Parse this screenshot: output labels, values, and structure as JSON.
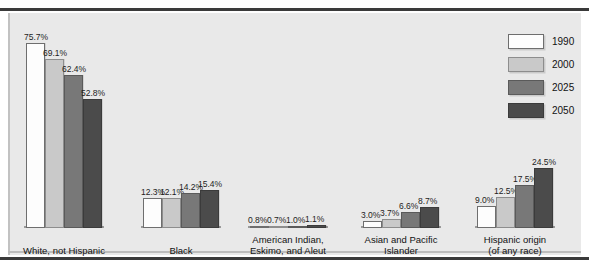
{
  "top_caption": "",
  "chart_data": {
    "type": "bar",
    "title": "",
    "xlabel": "",
    "ylabel": "",
    "ylim": [
      0,
      80
    ],
    "grid": false,
    "legend_position": "top-right",
    "categories": [
      "White, not Hispanic",
      "Black",
      "American Indian,\nEskimo, and Aleut",
      "Asian and Pacific\nIslander",
      "Hispanic origin\n(of any race)"
    ],
    "series": [
      {
        "name": "1990",
        "color": "#fdfdfd",
        "values": [
          75.7,
          12.3,
          0.8,
          3.0,
          9.0
        ]
      },
      {
        "name": "2000",
        "color": "#c9c9c9",
        "values": [
          69.1,
          12.1,
          0.7,
          3.7,
          12.5
        ]
      },
      {
        "name": "2025",
        "color": "#787878",
        "values": [
          62.4,
          14.2,
          1.0,
          6.6,
          17.5
        ]
      },
      {
        "name": "2050",
        "color": "#4b4b4b",
        "values": [
          52.8,
          15.4,
          1.1,
          8.7,
          24.5
        ]
      }
    ],
    "value_labels": [
      [
        "75.7%",
        "69.1%",
        "62.4%",
        "52.8%"
      ],
      [
        "12.3%",
        "12.1%",
        "14.2%",
        "15.4%"
      ],
      [
        "0.8%",
        "0.7%",
        "1.0%",
        "1.1%"
      ],
      [
        "3.0%",
        "3.7%",
        "6.6%",
        "8.7%"
      ],
      [
        "9.0%",
        "12.5%",
        "17.5%",
        "24.5%"
      ]
    ]
  },
  "legend": {
    "items": [
      {
        "label": "1990"
      },
      {
        "label": "2000"
      },
      {
        "label": "2025"
      },
      {
        "label": "2050"
      }
    ]
  }
}
